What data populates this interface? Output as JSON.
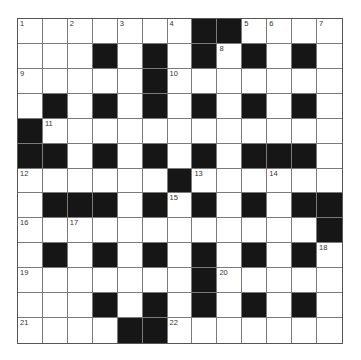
{
  "puzzle": {
    "rows": 13,
    "cols": 13,
    "colors": {
      "block": "#161616",
      "cell": "#ffffff",
      "line": "#7a7a7a",
      "number": "#333333"
    },
    "layout": [
      "WWWWWWWBBWWWW",
      "WWWBWBWBWBWBW",
      "WWWWWBWWWWWWW",
      "WBWBWBWBWBWBW",
      "BWWWWWWWWWWWW",
      "BBWBWBWBWBBBW",
      "WWWWWWBWWWWWW",
      "WBBBWBWBWBWBB",
      "WWWWWWWWWWWWB",
      "WBWBWBWBWBWBW",
      "WWWWWWWBWWWWW",
      "WWWBWBWBWBWBW",
      "WWWWBBWWWWWWW"
    ],
    "numbers": [
      {
        "row": 0,
        "col": 0,
        "label": "1"
      },
      {
        "row": 0,
        "col": 2,
        "label": "2"
      },
      {
        "row": 0,
        "col": 4,
        "label": "3"
      },
      {
        "row": 0,
        "col": 6,
        "label": "4"
      },
      {
        "row": 0,
        "col": 9,
        "label": "5"
      },
      {
        "row": 0,
        "col": 10,
        "label": "6"
      },
      {
        "row": 0,
        "col": 12,
        "label": "7"
      },
      {
        "row": 1,
        "col": 8,
        "label": "8"
      },
      {
        "row": 2,
        "col": 0,
        "label": "9"
      },
      {
        "row": 2,
        "col": 6,
        "label": "10"
      },
      {
        "row": 4,
        "col": 1,
        "label": "11"
      },
      {
        "row": 6,
        "col": 0,
        "label": "12"
      },
      {
        "row": 6,
        "col": 7,
        "label": "13"
      },
      {
        "row": 6,
        "col": 10,
        "label": "14"
      },
      {
        "row": 7,
        "col": 6,
        "label": "15"
      },
      {
        "row": 8,
        "col": 0,
        "label": "16"
      },
      {
        "row": 8,
        "col": 2,
        "label": "17"
      },
      {
        "row": 9,
        "col": 12,
        "label": "18"
      },
      {
        "row": 10,
        "col": 0,
        "label": "19"
      },
      {
        "row": 10,
        "col": 8,
        "label": "20"
      },
      {
        "row": 12,
        "col": 0,
        "label": "21"
      },
      {
        "row": 12,
        "col": 6,
        "label": "22"
      }
    ]
  }
}
